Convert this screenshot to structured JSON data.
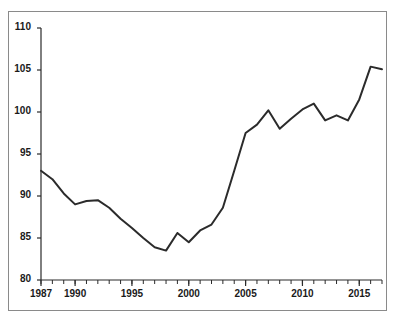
{
  "chart_data": {
    "type": "line",
    "title": "",
    "subtitle": "",
    "xlabel": "",
    "ylabel": "",
    "xlim": [
      1987,
      2017
    ],
    "ylim": [
      80,
      110
    ],
    "xticks": [
      1987,
      1990,
      1995,
      2000,
      2005,
      2010,
      2015
    ],
    "xtick_labels": [
      "1987",
      "1990",
      "1995",
      "2000",
      "2005",
      "2010",
      "2015"
    ],
    "yticks": [
      80,
      85,
      90,
      95,
      100,
      105,
      110
    ],
    "ytick_labels": [
      "80",
      "85",
      "90",
      "95",
      "100",
      "105",
      "110"
    ],
    "minor_xticks_every": 1,
    "grid": false,
    "legend": false,
    "legend_position": "none",
    "line_color": "#2b2b2b",
    "line_width": 2,
    "background_color": "#ffffff",
    "frame_color": "#8a8a8a",
    "series": [
      {
        "name": "index",
        "x": [
          1987,
          1988,
          1989,
          1990,
          1991,
          1992,
          1993,
          1994,
          1995,
          1996,
          1997,
          1998,
          1999,
          2000,
          2001,
          2002,
          2003,
          2004,
          2005,
          2006,
          2007,
          2008,
          2009,
          2010,
          2011,
          2012,
          2013,
          2014,
          2015,
          2016,
          2017
        ],
        "values": [
          93.0,
          92.0,
          90.3,
          89.0,
          89.4,
          89.5,
          88.6,
          87.3,
          86.2,
          85.0,
          83.9,
          83.5,
          85.6,
          84.5,
          85.9,
          86.6,
          88.6,
          93.0,
          97.5,
          98.5,
          100.2,
          98.0,
          99.2,
          100.3,
          101.0,
          99.0,
          99.6,
          99.0,
          101.5,
          105.4,
          105.1
        ]
      }
    ]
  }
}
